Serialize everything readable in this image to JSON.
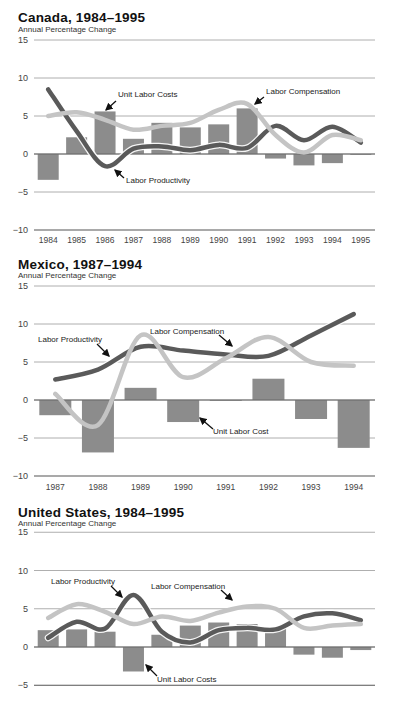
{
  "chart_data": [
    {
      "type": "bar",
      "title": "Canada, 1984–1995",
      "subtitle": "Annual Percentage Change",
      "ylabel": "Annual Percentage Change",
      "ylim": [
        -10,
        15
      ],
      "yticks": [
        15,
        10,
        5,
        0,
        -5,
        -10
      ],
      "grid": true,
      "categories": [
        "1984",
        "1985",
        "1986",
        "1987",
        "1988",
        "1989",
        "1990",
        "1991",
        "1992",
        "1993",
        "1994",
        "1995"
      ],
      "series": [
        {
          "name": "Unit Labor Costs",
          "kind": "bar",
          "color": "#8c8c8c",
          "values": [
            -3.4,
            2.2,
            5.6,
            2.0,
            4.1,
            3.5,
            3.9,
            6.0,
            -0.6,
            -1.5,
            -1.2,
            0.0
          ]
        },
        {
          "name": "Labor Productivity",
          "kind": "line",
          "color": "#5a5a5a",
          "values": [
            8.5,
            3.0,
            -1.6,
            0.7,
            1.0,
            0.5,
            1.2,
            0.8,
            3.7,
            1.8,
            3.6,
            1.5
          ]
        },
        {
          "name": "Labor Compensation",
          "kind": "line",
          "color": "#c4c4c4",
          "values": [
            5.0,
            5.5,
            4.5,
            3.2,
            3.7,
            4.1,
            5.8,
            6.6,
            2.5,
            0.2,
            2.5,
            1.8
          ]
        }
      ],
      "annotations": [
        {
          "text": "Unit Labor Costs",
          "x": "1986"
        },
        {
          "text": "Labor Compensation",
          "x": "1991"
        },
        {
          "text": "Labor Productivity",
          "x": "1986"
        }
      ]
    },
    {
      "type": "bar",
      "title": "Mexico, 1987–1994",
      "subtitle": "Annual Percentage Change",
      "ylabel": "Annual Percentage Change",
      "ylim": [
        -10,
        15
      ],
      "yticks": [
        15,
        10,
        5,
        0,
        -5,
        -10
      ],
      "grid": true,
      "categories": [
        "1987",
        "1988",
        "1989",
        "1990",
        "1991",
        "1992",
        "1993",
        "1994"
      ],
      "series": [
        {
          "name": "Unit Labor Cost",
          "kind": "bar",
          "color": "#8c8c8c",
          "values": [
            -2.0,
            -6.9,
            1.6,
            -2.9,
            0.0,
            2.8,
            -2.5,
            -6.3
          ]
        },
        {
          "name": "Labor Productivity",
          "kind": "line",
          "color": "#5a5a5a",
          "values": [
            2.7,
            4.0,
            7.0,
            6.5,
            6.0,
            5.8,
            8.5,
            11.3
          ]
        },
        {
          "name": "Labor Compensation",
          "kind": "line",
          "color": "#c4c4c4",
          "values": [
            0.8,
            -3.3,
            8.5,
            3.0,
            5.5,
            8.3,
            5.0,
            4.5
          ]
        }
      ],
      "annotations": [
        {
          "text": "Labor Productivity",
          "x": "1988"
        },
        {
          "text": "Labor Compensation",
          "x": "1990"
        },
        {
          "text": "Unit Labor Cost",
          "x": "1990"
        }
      ]
    },
    {
      "type": "bar",
      "title": "United States, 1984–1995",
      "subtitle": "Annual Percentage Change",
      "ylabel": "Annual Percentage Change",
      "ylim": [
        -5,
        15
      ],
      "yticks": [
        15,
        10,
        5,
        0,
        -5
      ],
      "grid": true,
      "categories": [
        "1984",
        "1985",
        "1986",
        "1987",
        "1988",
        "1989",
        "1990",
        "1991",
        "1992",
        "1993",
        "1994",
        "1995"
      ],
      "series": [
        {
          "name": "Unit Labor Costs",
          "kind": "bar",
          "color": "#8c8c8c",
          "values": [
            2.2,
            2.3,
            2.0,
            -3.2,
            1.6,
            2.8,
            3.2,
            3.0,
            2.5,
            -1.0,
            -1.4,
            -0.4
          ]
        },
        {
          "name": "Labor Productivity",
          "kind": "line",
          "color": "#5a5a5a",
          "values": [
            1.2,
            3.3,
            2.4,
            6.8,
            2.0,
            0.6,
            2.2,
            2.5,
            2.3,
            4.0,
            4.4,
            3.5
          ]
        },
        {
          "name": "Labor Compensation",
          "kind": "line",
          "color": "#c4c4c4",
          "values": [
            3.8,
            5.6,
            4.6,
            3.0,
            4.0,
            3.4,
            4.5,
            5.3,
            5.0,
            2.5,
            2.8,
            3.0
          ]
        }
      ],
      "annotations": [
        {
          "text": "Labor Productivity",
          "x": "1987"
        },
        {
          "text": "Labor Compensation",
          "x": "1990"
        },
        {
          "text": "Unit Labor Costs",
          "x": "1987"
        }
      ]
    }
  ],
  "panels": [
    {
      "title": "Canada, 1984–1995",
      "subtitle": "Annual Percentage Change"
    },
    {
      "title": "Mexico, 1987–1994",
      "subtitle": "Annual Percentage Change"
    },
    {
      "title": "United States, 1984–1995",
      "subtitle": "Annual Percentage Change"
    }
  ]
}
